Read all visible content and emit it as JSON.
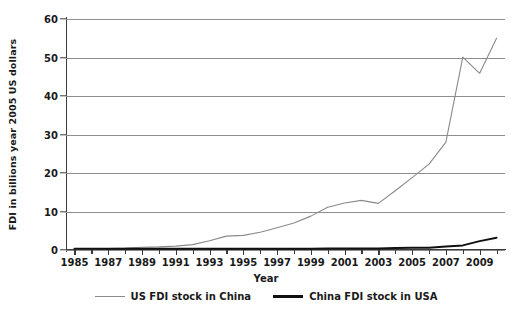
{
  "chart_data": {
    "type": "line",
    "title": "",
    "xlabel": "Year",
    "ylabel": "FDI in billions year 2005 US dollars",
    "xlim": [
      1984.5,
      2010.5
    ],
    "ylim": [
      0,
      60
    ],
    "yticks": [
      0,
      10,
      20,
      30,
      40,
      50,
      60
    ],
    "xticks": [
      1985,
      1987,
      1989,
      1991,
      1993,
      1995,
      1997,
      1999,
      2001,
      2003,
      2005,
      2007,
      2009
    ],
    "xtick_labels": [
      "1985",
      "1987",
      "1989",
      "1991",
      "1993",
      "1995",
      "1997",
      "1999",
      "2001",
      "2003",
      "2005",
      "2007",
      "2009"
    ],
    "ytick_labels": [
      "0",
      "10",
      "20",
      "30",
      "40",
      "50",
      "60"
    ],
    "grid": "horizontal",
    "legend_position": "bottom",
    "x": [
      1985,
      1986,
      1987,
      1988,
      1989,
      1990,
      1991,
      1992,
      1993,
      1994,
      1995,
      1996,
      1997,
      1998,
      1999,
      2000,
      2001,
      2002,
      2003,
      2004,
      2005,
      2006,
      2007,
      2008,
      2009,
      2010
    ],
    "series": [
      {
        "name": "US FDI stock in China",
        "color": "#8a8a8a",
        "width": 1.1,
        "values": [
          0.2,
          0.3,
          0.4,
          0.5,
          0.7,
          0.8,
          1.0,
          1.4,
          2.4,
          3.6,
          3.8,
          4.6,
          5.8,
          7.0,
          8.8,
          11.1,
          12.2,
          12.9,
          12.1,
          15.4,
          18.8,
          22.3,
          28.0,
          50.1,
          45.9,
          55.0
        ]
      },
      {
        "name": "China FDI stock in USA",
        "color": "#111111",
        "width": 2.0,
        "values": [
          0.3,
          0.3,
          0.3,
          0.3,
          0.3,
          0.3,
          0.3,
          0.3,
          0.3,
          0.3,
          0.3,
          0.3,
          0.3,
          0.3,
          0.3,
          0.4,
          0.4,
          0.4,
          0.4,
          0.5,
          0.6,
          0.6,
          0.9,
          1.2,
          2.3,
          3.2
        ]
      }
    ]
  }
}
